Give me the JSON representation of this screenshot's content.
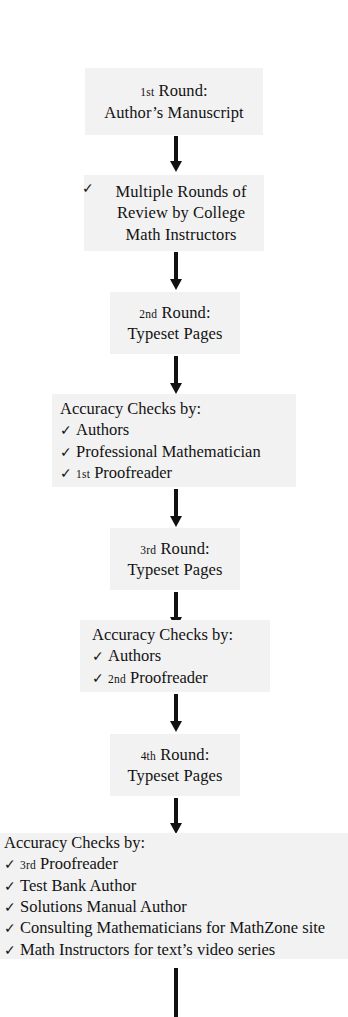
{
  "diagram": {
    "type": "flowchart",
    "orientation": "vertical",
    "colors": {
      "node_background": "#f2f2f2",
      "page_background": "#ffffff",
      "text": "#121212",
      "arrow": "#111111"
    },
    "check_glyph": "✓",
    "nodes": [
      {
        "id": "round-1",
        "lines": [
          {
            "ordinal": "1",
            "suffix": "st",
            "text": " Round:"
          },
          {
            "text": "Author’s Manuscript"
          }
        ]
      },
      {
        "id": "multiple-rounds-review",
        "lines": [
          {
            "checked": true,
            "text": "Multiple Rounds of"
          },
          {
            "text": "Review by College"
          },
          {
            "text": "Math Instructors"
          }
        ]
      },
      {
        "id": "round-2",
        "lines": [
          {
            "ordinal": "2",
            "suffix": "nd",
            "text": " Round:"
          },
          {
            "text": "Typeset Pages"
          }
        ]
      },
      {
        "id": "accuracy-checks-1",
        "header": "Accuracy Checks by:",
        "items": [
          {
            "text": "Authors"
          },
          {
            "text": "Professional Mathematician"
          },
          {
            "ordinal": "1",
            "suffix": "st",
            "text": " Proofreader"
          }
        ]
      },
      {
        "id": "round-3",
        "lines": [
          {
            "ordinal": "3",
            "suffix": "rd",
            "text": " Round:"
          },
          {
            "text": "Typeset Pages"
          }
        ]
      },
      {
        "id": "accuracy-checks-2",
        "header": "Accuracy Checks by:",
        "items": [
          {
            "text": "Authors"
          },
          {
            "ordinal": "2",
            "suffix": "nd",
            "text": " Proofreader"
          }
        ]
      },
      {
        "id": "round-4",
        "lines": [
          {
            "ordinal": "4",
            "suffix": "th",
            "text": " Round:"
          },
          {
            "text": "Typeset Pages"
          }
        ]
      },
      {
        "id": "accuracy-checks-3",
        "header": "Accuracy Checks by:",
        "items": [
          {
            "ordinal": "3",
            "suffix": "rd",
            "text": " Proofreader"
          },
          {
            "text": "Test Bank Author"
          },
          {
            "text": "Solutions Manual Author"
          },
          {
            "text": "Consulting Mathematicians for MathZone site"
          },
          {
            "text": "Math Instructors for text’s video series"
          }
        ]
      }
    ]
  },
  "n1": {
    "l1_ord": "1",
    "l1_sup": "st",
    "l1_rest": " Round:",
    "l2": "Author’s Manuscript"
  },
  "n2": {
    "check": "✓",
    "l1": "Multiple Rounds of",
    "l2": "Review by College",
    "l3": "Math Instructors"
  },
  "n3": {
    "l1_ord": "2",
    "l1_sup": "nd",
    "l1_rest": " Round:",
    "l2": "Typeset Pages"
  },
  "n4": {
    "header": "Accuracy Checks by:",
    "check": "✓",
    "i1": "Authors",
    "i2": "Professional Mathematician",
    "i3_ord": "1",
    "i3_sup": "st",
    "i3_rest": " Proofreader"
  },
  "n5": {
    "l1_ord": "3",
    "l1_sup": "rd",
    "l1_rest": " Round:",
    "l2": "Typeset Pages"
  },
  "n6": {
    "header": "Accuracy Checks by:",
    "check": "✓",
    "i1": "Authors",
    "i2_ord": "2",
    "i2_sup": "nd",
    "i2_rest": " Proofreader"
  },
  "n7": {
    "l1_ord": "4",
    "l1_sup": "th",
    "l1_rest": " Round:",
    "l2": "Typeset Pages"
  },
  "n8": {
    "header": "Accuracy Checks by:",
    "check": "✓",
    "i1_ord": "3",
    "i1_sup": "rd",
    "i1_rest": " Proofreader",
    "i2": "Test Bank Author",
    "i3": "Solutions Manual Author",
    "i4": "Consulting Mathematicians for MathZone site",
    "i5": "Math Instructors for text’s video series"
  }
}
